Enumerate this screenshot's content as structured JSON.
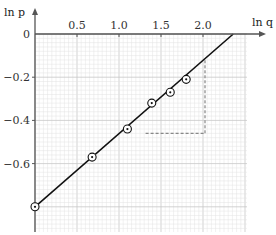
{
  "chart_data": {
    "type": "scatter",
    "title": "",
    "xlabel": "ln q",
    "ylabel": "ln p",
    "xlim": [
      0,
      2.5
    ],
    "ylim": [
      -0.9,
      0
    ],
    "x_ticks": [
      0.5,
      1.0,
      1.5,
      2.0
    ],
    "x_tick_labels": [
      "0.5",
      "1.0",
      "1.5",
      "2.0"
    ],
    "y_ticks": [
      0,
      -0.2,
      -0.4,
      -0.6
    ],
    "y_tick_labels": [
      "0",
      "−0.2",
      "−0.4",
      "−0.6"
    ],
    "grid": true,
    "legend": null,
    "series": [
      {
        "name": "data points",
        "marker": "circled-dot",
        "x": [
          0.0,
          0.68,
          1.1,
          1.39,
          1.61,
          1.8
        ],
        "y": [
          -0.8,
          -0.57,
          -0.44,
          -0.32,
          -0.27,
          -0.21
        ]
      },
      {
        "name": "best-fit line",
        "type": "line",
        "x": [
          0.0,
          2.36
        ],
        "y": [
          -0.8,
          0.0
        ]
      }
    ],
    "annotations": [
      {
        "type": "gradient-triangle",
        "style": "dashed",
        "horizontal": {
          "from_x": 0.9,
          "to_x": 2.0,
          "y": -0.46
        },
        "vertical": {
          "x": 2.0,
          "from_y": -0.46,
          "to_y": -0.12
        }
      }
    ]
  },
  "colors": {
    "axis": "#555555",
    "grid_minor": "#e2e2e2",
    "grid_major": "#c8c8c8",
    "line": "#111111",
    "dashed": "#888888"
  }
}
